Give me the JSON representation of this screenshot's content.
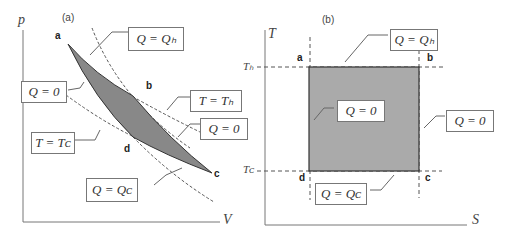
{
  "panel_a": {
    "tag": "(a)",
    "y_axis": "p",
    "x_axis": "V",
    "points": {
      "a": "a",
      "b": "b",
      "c": "c",
      "d": "d"
    },
    "labels": {
      "qh": "Q = Qₕ",
      "q0_left": "Q = 0",
      "th": "T = Tₕ",
      "q0_right": "Q = 0",
      "tc": "T = Tᴄ",
      "qc": "Q = Qᴄ"
    }
  },
  "panel_b": {
    "tag": "(b)",
    "y_axis": "T",
    "x_axis": "S",
    "th_tick": "Tₕ",
    "tc_tick": "Tᴄ",
    "points": {
      "a": "a",
      "b": "b",
      "c": "c",
      "d": "d"
    },
    "labels": {
      "qh": "Q = Qₕ",
      "q0_inner": "Q = 0",
      "q0_right": "Q = 0",
      "qc": "Q = Qᴄ"
    }
  }
}
